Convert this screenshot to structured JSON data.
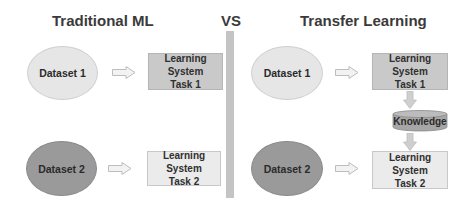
{
  "titles": {
    "left": "Traditional ML",
    "vs": "VS",
    "right": "Transfer Learning"
  },
  "traditional": {
    "dataset1": "Dataset 1",
    "dataset2": "Dataset 2",
    "task1": {
      "line1": "Learning System",
      "line2": "Task 1"
    },
    "task2": {
      "line1": "Learning System",
      "line2": "Task 2"
    }
  },
  "transfer": {
    "dataset1": "Dataset 1",
    "dataset2": "Dataset 2",
    "task1": {
      "line1": "Learning System",
      "line2": "Task 1"
    },
    "task2": {
      "line1": "Learning System",
      "line2": "Task 2"
    },
    "knowledge": "Knowledge"
  },
  "colors": {
    "light_fill": "#e6e6e6",
    "dark_fill": "#9a9a9a",
    "box_dark": "#c9c9c9",
    "box_light": "#ebebeb",
    "separator": "#c4c4c4"
  }
}
